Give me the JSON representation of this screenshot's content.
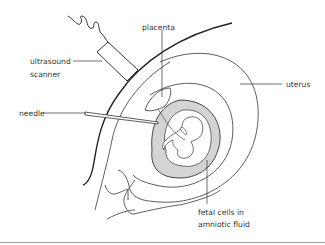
{
  "diagram": {
    "type": "anatomical illustration",
    "labels": {
      "placenta": "placenta",
      "ultrasound_line1": "ultrasound",
      "ultrasound_line2": "scanner",
      "uterus": "uterus",
      "needle": "needle",
      "fetal_line1": "fetal cells in",
      "fetal_line2": "amniotic fluid"
    },
    "colors": {
      "line": "#333333",
      "amniotic_fill": "#d4d4d4",
      "background": "#ffffff",
      "rule": "#9a9a9a"
    }
  }
}
